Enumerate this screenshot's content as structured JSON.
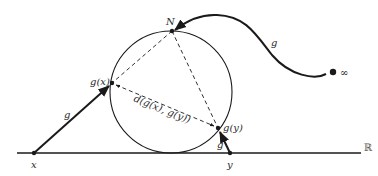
{
  "diagram": {
    "colors": {
      "stroke": "#1a1a1a",
      "background": "#ffffff",
      "real_line_label": "#555555"
    },
    "labels": {
      "north_pole": "N",
      "gx": "g(x)",
      "gy": "g(y)",
      "x": "x",
      "y": "y",
      "real_line": "ℝ",
      "infinity": "∞",
      "distance": "d(g(x), g(y))",
      "map_g_left": "g",
      "map_g_right": "g",
      "map_g_top": "g"
    },
    "points": {
      "N": [
        172,
        31
      ],
      "gx": [
        112,
        83
      ],
      "gy": [
        218,
        128
      ],
      "x": [
        34,
        153
      ],
      "y": [
        230,
        153
      ],
      "infinity": [
        333,
        72
      ]
    },
    "circle": {
      "cx": 171,
      "cy": 92,
      "r": 61
    },
    "real_line": {
      "x1": 17,
      "x2": 361,
      "y": 153
    }
  }
}
